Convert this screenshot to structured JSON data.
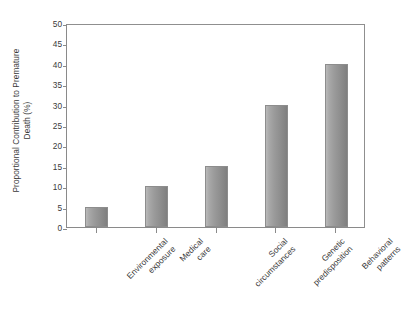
{
  "chart_data": {
    "type": "bar",
    "title": "",
    "xlabel": "",
    "ylabel": "Proportional Contribution to Premature Death (%)",
    "ylabel_line1": "Proportional Contribution to Premature",
    "ylabel_line2": "Death (%)",
    "categories": [
      "Environmental exposure",
      "Medical care",
      "Social circumstances",
      "Genetic predisposition",
      "Behavioral patterns"
    ],
    "category_lines": [
      [
        "Environmental",
        "exposure"
      ],
      [
        "Medical",
        "care"
      ],
      [
        "Social",
        "circumstances"
      ],
      [
        "Genetic",
        "predisposition"
      ],
      [
        "Behavioral",
        "patterns"
      ]
    ],
    "values": [
      5,
      10,
      15,
      30,
      40
    ],
    "ylim": [
      0,
      50
    ],
    "ytick_values": [
      0,
      5,
      10,
      15,
      20,
      25,
      30,
      35,
      40,
      45,
      50
    ],
    "ytick_labels": [
      "0",
      "5",
      "10",
      "15",
      "20",
      "25",
      "30",
      "35",
      "40",
      "45",
      "50"
    ],
    "grid": false,
    "legend": null,
    "bar_color_light": "#b9b9b9",
    "bar_color_dark": "#7f7f7f",
    "bar_edge_color": "#8d8d8d",
    "axis_color": "#8a8a8a",
    "text_color": "#3a3a3a",
    "background": "#ffffff"
  }
}
